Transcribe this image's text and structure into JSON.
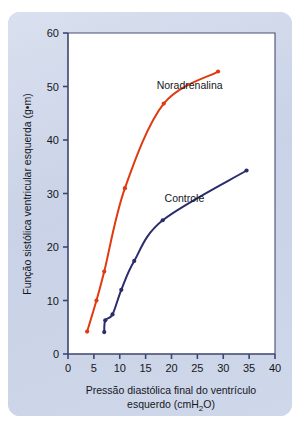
{
  "chart_data": {
    "type": "line",
    "title": "",
    "xlabel": "Pressão diastólica final do ventrículo esquerdo (cmH2O)",
    "xlabel_line1": "Pressão diastólica final do ventrículo",
    "xlabel_line2_pre": "esquerdo (cmH",
    "xlabel_line2_sub": "2",
    "xlabel_line2_post": "O)",
    "ylabel": "Função sistólica ventricular esquerda (g•m)",
    "xlim": [
      0,
      40
    ],
    "ylim": [
      0,
      60
    ],
    "xticks": [
      0,
      5,
      10,
      15,
      20,
      25,
      30,
      35,
      40
    ],
    "yticks": [
      0,
      10,
      20,
      30,
      40,
      50,
      60
    ],
    "xtick_labels": [
      "0",
      "5",
      "10",
      "15",
      "20",
      "25",
      "30",
      "35",
      "40"
    ],
    "ytick_labels": [
      "0",
      "10",
      "20",
      "30",
      "40",
      "50",
      "60"
    ],
    "grid": false,
    "legend_position": "inline-annotation",
    "series": [
      {
        "name": "Noradrenalina",
        "color": "#e03a10",
        "label_x": 23.5,
        "label_y": 49.5,
        "points": [
          {
            "x": 3.7,
            "y": 4.2
          },
          {
            "x": 5.5,
            "y": 10.0
          },
          {
            "x": 7.0,
            "y": 15.4
          },
          {
            "x": 11.0,
            "y": 31.0
          },
          {
            "x": 18.5,
            "y": 46.8
          },
          {
            "x": 29.0,
            "y": 52.8
          }
        ]
      },
      {
        "name": "Controle",
        "color": "#2a2d6b",
        "label_x": 22.5,
        "label_y": 28.5,
        "points": [
          {
            "x": 7.0,
            "y": 4.1
          },
          {
            "x": 7.2,
            "y": 6.3
          },
          {
            "x": 8.6,
            "y": 7.4
          },
          {
            "x": 10.3,
            "y": 12.0
          },
          {
            "x": 12.8,
            "y": 17.4
          },
          {
            "x": 18.3,
            "y": 25.0
          },
          {
            "x": 34.5,
            "y": 34.3
          }
        ]
      }
    ]
  },
  "style": {
    "panel_background": "#ccd4e8",
    "plot_background": "#ffffff",
    "axis_color": "#3f4572",
    "text_color": "#15161c"
  },
  "geometry": {
    "plot_left": 68,
    "plot_right": 275,
    "plot_top": 33,
    "plot_bottom": 354
  }
}
